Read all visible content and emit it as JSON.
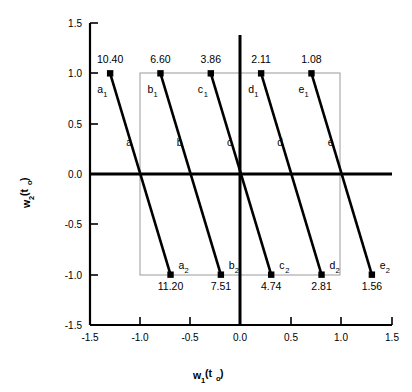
{
  "chart_data": {
    "type": "line",
    "title": "",
    "xlabel": "w1(to)",
    "ylabel": "w2(to)",
    "xlim": [
      -1.5,
      1.5
    ],
    "ylim": [
      -1.5,
      1.5
    ],
    "xticks": [
      "-1.5",
      "-1.0",
      "-0.5",
      "0.0",
      "0.5",
      "1.0",
      "1.5"
    ],
    "yticks": [
      "1.5",
      "1.0",
      "0.5",
      "0.0",
      "-0.5",
      "-1.0",
      "-1.5"
    ],
    "grid": false,
    "legend": "none",
    "inner_box": {
      "x0": -1.0,
      "x1": 1.0,
      "y0": -1.0,
      "y1": 1.0
    },
    "series": [
      {
        "name": "a",
        "mid_label": "a",
        "top": {
          "label": "a",
          "sub": "1",
          "value": "10.40",
          "x": -1.3,
          "y": 1.0
        },
        "bottom": {
          "label": "a",
          "sub": "2",
          "value": "11.20",
          "x": -0.7,
          "y": -1.0
        }
      },
      {
        "name": "b",
        "mid_label": "b",
        "top": {
          "label": "b",
          "sub": "1",
          "value": "6.60",
          "x": -0.8,
          "y": 1.0
        },
        "bottom": {
          "label": "b",
          "sub": "2",
          "value": "7.51",
          "x": -0.2,
          "y": -1.0
        }
      },
      {
        "name": "c",
        "mid_label": "c",
        "top": {
          "label": "c",
          "sub": "1",
          "value": "3.86",
          "x": -0.3,
          "y": 1.0
        },
        "bottom": {
          "label": "c",
          "sub": "2",
          "value": "4.74",
          "x": 0.3,
          "y": -1.0
        }
      },
      {
        "name": "d",
        "mid_label": "d",
        "top": {
          "label": "d",
          "sub": "1",
          "value": "2.11",
          "x": 0.2,
          "y": 1.0
        },
        "bottom": {
          "label": "d",
          "sub": "2",
          "value": "2.81",
          "x": 0.8,
          "y": -1.0
        }
      },
      {
        "name": "e",
        "mid_label": "e",
        "top": {
          "label": "e",
          "sub": "1",
          "value": "1.08",
          "x": 0.7,
          "y": 1.0
        },
        "bottom": {
          "label": "e",
          "sub": "2",
          "value": "1.56",
          "x": 1.3,
          "y": -1.0
        }
      }
    ],
    "axis_label_parts": {
      "x_main": "w",
      "x_sub": "1",
      "x_paren_open": "(t",
      "x_sub2": "o",
      "x_paren_close": ")",
      "y_main": "w",
      "y_sub": "2",
      "y_paren_open": "(t",
      "y_sub2": "o",
      "y_paren_close": ")"
    },
    "colors": {
      "line": "#000000",
      "axis": "#000000",
      "inner_box": "#808080",
      "marker": "#000000",
      "background": "#ffffff"
    }
  }
}
